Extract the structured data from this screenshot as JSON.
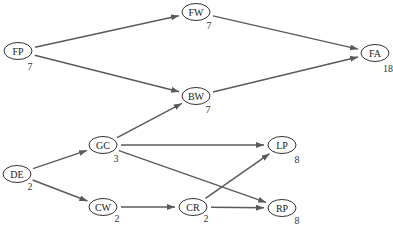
{
  "diagram": {
    "type": "activity-network",
    "colors": {
      "edge": "#5a5a5a",
      "node_stroke": "#333333",
      "text": "#222222"
    },
    "nodes": [
      {
        "id": "FP",
        "label": "FP",
        "duration": "7",
        "cx": 18,
        "cy": 51,
        "dx": 30,
        "dy": 66
      },
      {
        "id": "FW",
        "label": "FW",
        "duration": "7",
        "cx": 196,
        "cy": 12,
        "dx": 209,
        "dy": 25
      },
      {
        "id": "FA",
        "label": "FA",
        "duration": "18",
        "cx": 375,
        "cy": 53,
        "dx": 388,
        "dy": 68
      },
      {
        "id": "BW",
        "label": "BW",
        "duration": "7",
        "cx": 196,
        "cy": 96,
        "dx": 208,
        "dy": 109
      },
      {
        "id": "GC",
        "label": "GC",
        "duration": "3",
        "cx": 103,
        "cy": 145,
        "dx": 116,
        "dy": 158
      },
      {
        "id": "DE",
        "label": "DE",
        "duration": "2",
        "cx": 17,
        "cy": 174,
        "dx": 30,
        "dy": 186
      },
      {
        "id": "CW",
        "label": "CW",
        "duration": "2",
        "cx": 103,
        "cy": 207,
        "dx": 117,
        "dy": 218
      },
      {
        "id": "CR",
        "label": "CR",
        "duration": "2",
        "cx": 193,
        "cy": 207,
        "dx": 206,
        "dy": 218
      },
      {
        "id": "LP",
        "label": "LP",
        "duration": "8",
        "cx": 282,
        "cy": 145,
        "dx": 297,
        "dy": 159
      },
      {
        "id": "RP",
        "label": "RP",
        "duration": "8",
        "cx": 282,
        "cy": 208,
        "dx": 297,
        "dy": 220
      }
    ],
    "edges": [
      {
        "from": "FP",
        "to": "FW"
      },
      {
        "from": "FP",
        "to": "BW"
      },
      {
        "from": "FW",
        "to": "FA"
      },
      {
        "from": "BW",
        "to": "FA"
      },
      {
        "from": "GC",
        "to": "BW"
      },
      {
        "from": "DE",
        "to": "GC"
      },
      {
        "from": "DE",
        "to": "CW"
      },
      {
        "from": "GC",
        "to": "LP"
      },
      {
        "from": "GC",
        "to": "RP"
      },
      {
        "from": "CW",
        "to": "CR"
      },
      {
        "from": "CR",
        "to": "LP"
      },
      {
        "from": "CR",
        "to": "RP"
      }
    ]
  }
}
